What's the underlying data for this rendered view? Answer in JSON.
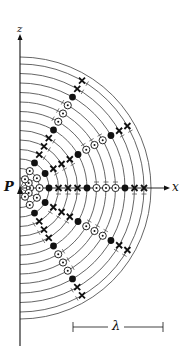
{
  "figure": {
    "origin_label": "P",
    "x_axis_label": "x",
    "z_axis_label": "z",
    "scale_label": "λ",
    "colors": {
      "line": "#555555",
      "ink": "#111111",
      "bg": "#ffffff"
    },
    "origin": [
      20,
      188
    ],
    "arc_radii": [
      10,
      19.5,
      29,
      38.5,
      48,
      57.5,
      67,
      76.5,
      86,
      95.5,
      105,
      114.5,
      124,
      131
    ],
    "radial_angles_deg": [
      0,
      30,
      -30,
      60,
      -60
    ],
    "markers_by_arc": [
      "dot",
      "dot",
      "filled",
      "cross",
      "cross",
      "cross",
      "filled",
      "dot",
      "dot",
      "dot",
      "filled",
      "cross",
      "cross"
    ],
    "marker_legend": {
      "dot": "circle-with-dot (field out of page)",
      "cross": "cross (field into page)",
      "filled": "filled circle (node)"
    },
    "scale_bar": {
      "x1": 73,
      "x2": 163,
      "y": 327
    }
  }
}
